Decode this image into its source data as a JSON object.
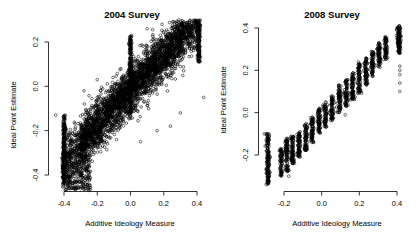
{
  "figure": {
    "background": "#ffffff",
    "point_color": "#000000",
    "point_style": "open-circle",
    "panels": 2
  },
  "chart_data": [
    {
      "type": "scatter",
      "title": "2004 Survey",
      "xlabel": "Additive Ideology Measure",
      "ylabel": "Ideal Point Estimate",
      "xlim": [
        -0.46,
        0.45
      ],
      "ylim": [
        -0.5,
        0.3
      ],
      "xticks": [
        -0.4,
        -0.2,
        0.0,
        0.2,
        0.4
      ],
      "xtick_labels": [
        "-0.4",
        "-0.2",
        "0.0",
        "0.2",
        "0.4"
      ],
      "yticks": [
        -0.4,
        -0.2,
        0.0,
        0.2
      ],
      "ytick_labels": [
        "-0.4",
        "-0.2",
        "0.0",
        "0.2"
      ],
      "grid": false,
      "legend": "none",
      "marker": "open-circle",
      "n_points_approx": 4200,
      "description": "Dense positively-correlated cloud of open circles rising from lower-left to upper-right; saturated vertical stacks at x=-0.40, x=0.00 and x=0.41.",
      "clusters": [
        {
          "x": -0.4,
          "y_min": -0.44,
          "y_max": -0.13,
          "n": 210,
          "note": "left saturated column"
        },
        {
          "x": 0.0,
          "y_min": -0.13,
          "y_max": 0.23,
          "n": 260,
          "note": "center saturated column"
        },
        {
          "x": 0.41,
          "y_min": 0.11,
          "y_max": 0.28,
          "n": 150,
          "note": "right saturated column"
        }
      ],
      "outliers": [
        {
          "x": -0.45,
          "y": -0.13
        },
        {
          "x": 0.44,
          "y": -0.05
        },
        {
          "x": 0.24,
          "y": -0.18
        },
        {
          "x": 0.3,
          "y": -0.12
        },
        {
          "x": 0.16,
          "y": -0.2
        },
        {
          "x": 0.06,
          "y": -0.25
        },
        {
          "x": -0.28,
          "y": -0.02
        },
        {
          "x": -0.2,
          "y": 0.03
        },
        {
          "x": 0.1,
          "y": 0.26
        },
        {
          "x": 0.19,
          "y": 0.28
        }
      ]
    },
    {
      "type": "scatter",
      "title": "2008 Survey",
      "xlabel": "Additive Ideology Measure",
      "ylabel": "Ideal Point Estimate",
      "xlim": [
        -0.33,
        0.45
      ],
      "ylim": [
        -0.36,
        0.45
      ],
      "xticks": [
        -0.2,
        0.0,
        0.2,
        0.4
      ],
      "xtick_labels": [
        "-0.2",
        "0.0",
        "0.2",
        "0.4"
      ],
      "yticks": [
        -0.2,
        0.0,
        0.2,
        0.4
      ],
      "ytick_labels": [
        "-0.2",
        "0.0",
        "0.2",
        "0.4"
      ],
      "grid": false,
      "legend": "none",
      "marker": "open-circle",
      "n_points_approx": 2100,
      "description": "Positively-correlated scatter made of discrete vertical bands (quantized additive measure) rising from lower-left to upper-right; saturated columns at x=-0.28 and x=0.41.",
      "bands": [
        {
          "x": -0.285,
          "y_min": -0.34,
          "y_max": -0.1,
          "n": 150
        },
        {
          "x": -0.215,
          "y_min": -0.3,
          "y_max": -0.17,
          "n": 70
        },
        {
          "x": -0.185,
          "y_min": -0.28,
          "y_max": -0.12,
          "n": 95
        },
        {
          "x": -0.155,
          "y_min": -0.24,
          "y_max": -0.11,
          "n": 90
        },
        {
          "x": -0.12,
          "y_min": -0.21,
          "y_max": -0.09,
          "n": 80
        },
        {
          "x": -0.085,
          "y_min": -0.18,
          "y_max": -0.05,
          "n": 80
        },
        {
          "x": -0.05,
          "y_min": -0.14,
          "y_max": -0.02,
          "n": 75
        },
        {
          "x": -0.015,
          "y_min": -0.11,
          "y_max": 0.02,
          "n": 75
        },
        {
          "x": 0.02,
          "y_min": -0.07,
          "y_max": 0.05,
          "n": 70
        },
        {
          "x": 0.055,
          "y_min": -0.04,
          "y_max": 0.08,
          "n": 70
        },
        {
          "x": 0.095,
          "y_min": 0.0,
          "y_max": 0.13,
          "n": 75
        },
        {
          "x": 0.13,
          "y_min": 0.03,
          "y_max": 0.16,
          "n": 75
        },
        {
          "x": 0.165,
          "y_min": 0.06,
          "y_max": 0.19,
          "n": 75
        },
        {
          "x": 0.2,
          "y_min": 0.09,
          "y_max": 0.23,
          "n": 80
        },
        {
          "x": 0.235,
          "y_min": 0.13,
          "y_max": 0.26,
          "n": 80
        },
        {
          "x": 0.27,
          "y_min": 0.17,
          "y_max": 0.29,
          "n": 75
        },
        {
          "x": 0.305,
          "y_min": 0.21,
          "y_max": 0.33,
          "n": 70
        },
        {
          "x": 0.34,
          "y_min": 0.25,
          "y_max": 0.36,
          "n": 65
        },
        {
          "x": 0.41,
          "y_min": 0.28,
          "y_max": 0.41,
          "n": 130
        }
      ],
      "outliers": [
        {
          "x": 0.415,
          "y": 0.22
        },
        {
          "x": 0.415,
          "y": 0.2
        },
        {
          "x": 0.415,
          "y": 0.18
        },
        {
          "x": 0.415,
          "y": 0.14
        },
        {
          "x": 0.415,
          "y": 0.1
        },
        {
          "x": 0.125,
          "y": -0.01
        },
        {
          "x": 0.195,
          "y": 0.24
        },
        {
          "x": 0.16,
          "y": 0.12
        },
        {
          "x": -0.305,
          "y": -0.1
        },
        {
          "x": -0.295,
          "y": -0.1
        },
        {
          "x": -0.285,
          "y": -0.1
        },
        {
          "x": -0.175,
          "y": -0.3
        }
      ]
    }
  ]
}
